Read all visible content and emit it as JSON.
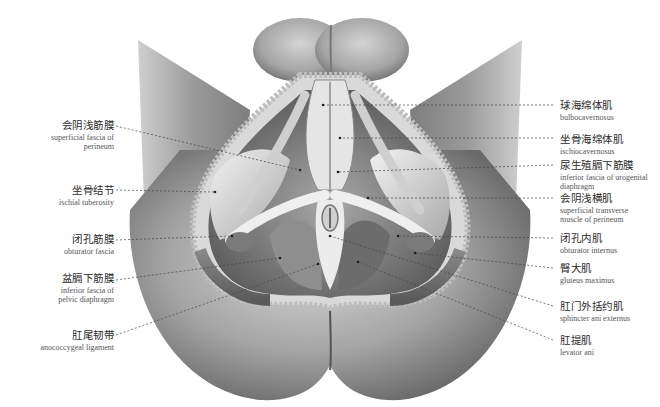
{
  "figure": {
    "line_color": "#444444",
    "ink_color": "#2a2a2a"
  },
  "labels_left": [
    {
      "zh": "会阴浅筋膜",
      "en": "superficial fascia of perineum",
      "en_lines": [
        "superficial fascia of",
        "perineum"
      ]
    },
    {
      "zh": "坐骨结节",
      "en": "ischial tuberosity",
      "en_lines": [
        "ischial tuberosity"
      ]
    },
    {
      "zh": "闭孔筋膜",
      "en": "obturator fascia",
      "en_lines": [
        "obturator fascia"
      ]
    },
    {
      "zh": "盆膈下筋膜",
      "en": "inferior fascia of pelvic diaphragm",
      "en_lines": [
        "inferior fascia of",
        "pelvic diaphragm"
      ]
    },
    {
      "zh": "肛尾韧带",
      "en": "anococcygeal ligament",
      "en_lines": [
        "anococcygeal ligament"
      ]
    }
  ],
  "labels_right": [
    {
      "zh": "球海绵体肌",
      "en": "bulbocavernosus",
      "en_lines": [
        "bulbocavernosus"
      ]
    },
    {
      "zh": "坐骨海绵体肌",
      "en": "ischiocavernosus",
      "en_lines": [
        "ischiocavernosus"
      ]
    },
    {
      "zh": "尿生殖膈下筋膜",
      "en": "inferior fascia of urogenital diaphragm",
      "en_lines": [
        "inferior fascia of urogenital",
        "diaphragm"
      ]
    },
    {
      "zh": "会阴浅横肌",
      "en": "superficial transverse muscle of perineum",
      "en_lines": [
        "superficial transverse",
        "muscle of perineum"
      ]
    },
    {
      "zh": "闭孔内肌",
      "en": "obturator internus",
      "en_lines": [
        "obturator internus"
      ]
    },
    {
      "zh": "臀大肌",
      "en": "gluteus maximus",
      "en_lines": [
        "gluteus maximus"
      ]
    },
    {
      "zh": "肛门外括约肌",
      "en": "sphincter ani externus",
      "en_lines": [
        "sphincter ani externus"
      ]
    },
    {
      "zh": "肛提肌",
      "en": "levator ani",
      "en_lines": [
        "levator ani"
      ]
    }
  ]
}
